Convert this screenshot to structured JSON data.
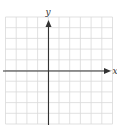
{
  "diagram": {
    "type": "coordinate-plane",
    "x_axis_label": "x",
    "y_axis_label": "y",
    "grid": {
      "columns": 10,
      "rows": 10,
      "columns_left_of_y_axis": 4,
      "columns_right_of_y_axis": 6,
      "rows_above_x_axis": 5,
      "rows_below_x_axis": 5,
      "ticks_labeled": false
    },
    "colors": {
      "grid_line": "#d9d9d9",
      "axis_line": "#333333",
      "background": "#ffffff"
    }
  }
}
